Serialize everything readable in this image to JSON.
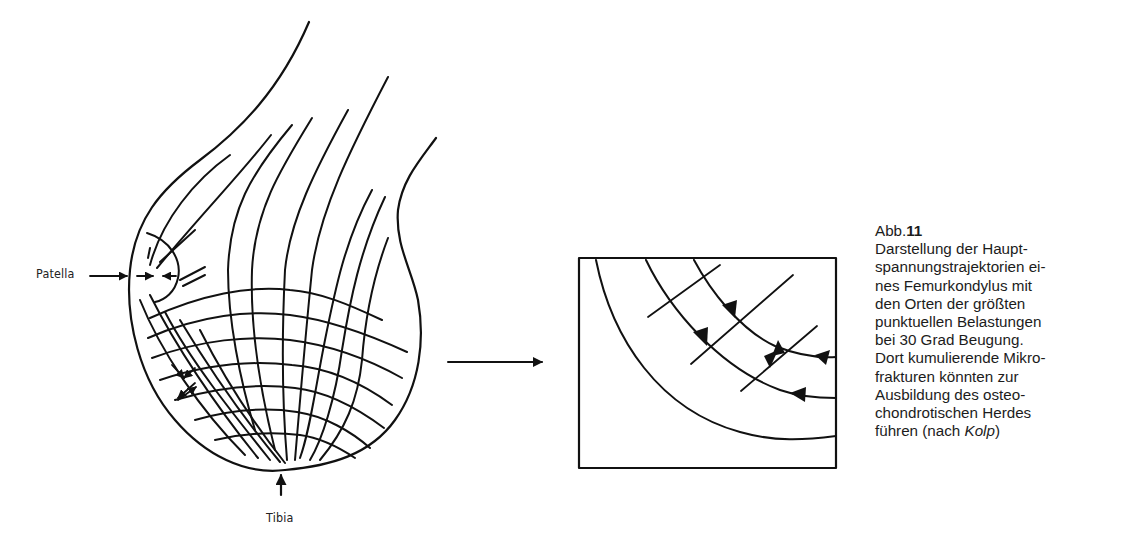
{
  "figure": {
    "labels": {
      "patella": "Patella",
      "tibia": "Tibia"
    },
    "left_panel": "Femurkondylus mit Hauptspannungstrajektorien",
    "right_panel": "Vergrößerter Ausschnitt mit Belastungspfeilen",
    "connector": "arrow-right"
  },
  "caption": {
    "abb_prefix": "Abb.",
    "abb_number": "11",
    "lines": [
      "Darstellung der Haupt-",
      "spannungstrajektorien ei-",
      "nes Femurkondylus mit",
      "den Orten der größten",
      "punktuellen Belastungen",
      "bei 30 Grad Beugung.",
      "Dort kumulierende Mikro-",
      "frakturen könnten zur",
      "Ausbildung des osteo-",
      "chondrotischen Herdes"
    ],
    "last_line_prefix": "führen (nach ",
    "last_line_author": "Kolp",
    "last_line_suffix": ")"
  }
}
